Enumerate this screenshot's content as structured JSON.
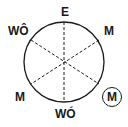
{
  "diagram": {
    "labels": {
      "top": "E",
      "top_right": "M",
      "top_left": "WÔ",
      "bottom_left": "M",
      "bottom": "WÓ",
      "bottom_right_circled": "M"
    },
    "colors": {
      "stroke": "#1a1a1a",
      "background": "#ffffff"
    }
  }
}
